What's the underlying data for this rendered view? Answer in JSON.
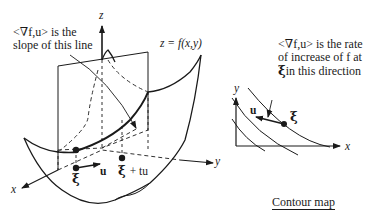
{
  "surface_plot": {
    "slope_annotation_line1": "<∇f,u> is the",
    "slope_annotation_line2": "slope of this line",
    "surface_label": "z = f(x,y)",
    "axis_z": "z",
    "axis_x": "x",
    "axis_y": "y",
    "point_xi": "ξ",
    "vector_u": "u",
    "point_xi_plus": "ξ",
    "point_xi_plus_suffix": "+ tu"
  },
  "contour_map": {
    "rate_annotation_line1": "<∇f,u> is the rate",
    "rate_annotation_line2": "of increase of f at",
    "rate_annotation_line3_xi": "ξ",
    "rate_annotation_line3": "in this direction",
    "axis_x": "x",
    "axis_y": "y",
    "vector_u": "u",
    "point_xi": "ξ",
    "caption": "Contour map"
  },
  "colors": {
    "ink": "#1a1a1a",
    "background": "#ffffff"
  }
}
